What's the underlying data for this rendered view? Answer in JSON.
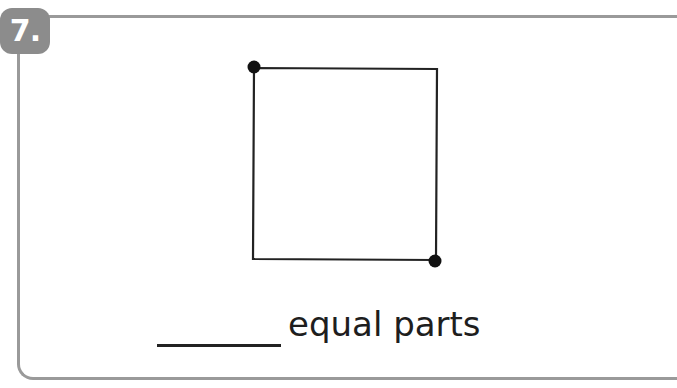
{
  "question": {
    "number_label": "7.",
    "answer_blank": "",
    "suffix_text": "equal parts"
  },
  "figure": {
    "shape": "square",
    "corners": {
      "top_left": [
        253,
        68
      ],
      "top_right": [
        437,
        68
      ],
      "bottom_right": [
        437,
        260
      ],
      "bottom_left": [
        253,
        260
      ]
    },
    "dots": [
      {
        "position": "top-left",
        "x": 254,
        "y": 67
      },
      {
        "position": "bottom-right",
        "x": 435,
        "y": 261
      }
    ],
    "stroke_color": "#222222"
  },
  "colors": {
    "frame": "#9a9a9a",
    "badge": "#8c8c8c",
    "text": "#1e1e1e"
  }
}
